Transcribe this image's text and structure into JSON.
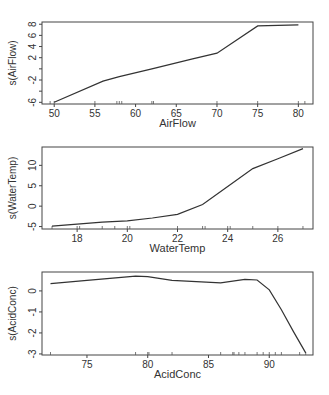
{
  "chart_data": [
    {
      "type": "line",
      "title": "",
      "xlabel": "AirFlow",
      "ylabel": "s(AirFlow)",
      "xlim": [
        48.5,
        81.8
      ],
      "ylim": [
        -6.3,
        8.4
      ],
      "xticks": [
        50,
        55,
        60,
        65,
        70,
        75,
        80
      ],
      "yticks": [
        -6,
        -4,
        -2,
        0,
        2,
        4,
        6,
        8
      ],
      "ytick_labels": [
        "-6",
        "",
        "-2",
        "",
        "2",
        "4",
        "6",
        "8"
      ],
      "grid": false,
      "legend": null,
      "x": [
        50,
        56,
        58,
        62,
        67,
        70,
        75,
        80
      ],
      "y": [
        -6.0,
        -2.2,
        -1.4,
        0.0,
        1.8,
        2.8,
        7.7,
        7.9
      ],
      "rug": [
        49.5,
        50,
        55,
        57.7,
        58,
        58.3,
        62,
        62.2,
        70,
        75,
        80,
        80.8
      ]
    },
    {
      "type": "line",
      "title": "",
      "xlabel": "WaterTemp",
      "ylabel": "s(WaterTemp)",
      "xlim": [
        16.6,
        27.4
      ],
      "ylim": [
        -5.6,
        14.5
      ],
      "xticks": [
        18,
        20,
        22,
        24,
        26
      ],
      "yticks": [
        -5,
        0,
        5,
        10
      ],
      "grid": false,
      "legend": null,
      "x": [
        17,
        18,
        19,
        20,
        21,
        22,
        23,
        24,
        25,
        26,
        27
      ],
      "y": [
        -4.9,
        -4.4,
        -3.9,
        -3.6,
        -2.9,
        -2.0,
        0.4,
        4.8,
        9.2,
        11.6,
        14.1
      ],
      "rug": [
        17,
        18,
        18.1,
        19,
        19.5,
        20,
        20.1,
        22,
        23,
        23.1,
        24,
        24.1,
        25,
        26,
        27
      ]
    },
    {
      "type": "line",
      "title": "",
      "xlabel": "AcidConc",
      "ylabel": "s(AcidConc)",
      "xlim": [
        71.3,
        93.6
      ],
      "ylim": [
        -3.05,
        0.9
      ],
      "xticks": [
        75,
        80,
        85,
        90
      ],
      "yticks": [
        -3,
        -2,
        -1,
        0
      ],
      "grid": false,
      "legend": null,
      "x": [
        72,
        75,
        79,
        80,
        82,
        86,
        88,
        89,
        90,
        91,
        92,
        93
      ],
      "y": [
        0.35,
        0.5,
        0.7,
        0.68,
        0.5,
        0.38,
        0.55,
        0.52,
        0.05,
        -0.9,
        -1.95,
        -2.95
      ],
      "rug": [
        72,
        79,
        80,
        80.1,
        82,
        86,
        87,
        87.1,
        87.5,
        88,
        89,
        89.5,
        90,
        90.5,
        91,
        92.5,
        93
      ]
    }
  ]
}
